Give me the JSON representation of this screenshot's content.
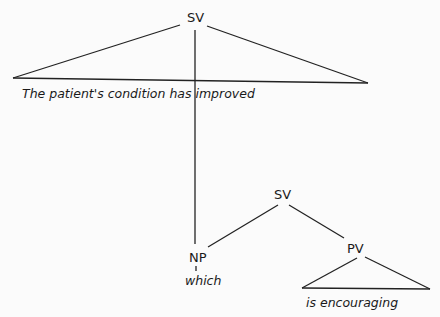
{
  "diagram": {
    "type": "syntax-tree",
    "nodes": {
      "top_sv": "SV",
      "lower_sv": "SV",
      "np": "NP",
      "pv": "PV"
    },
    "leaves": {
      "top_phrase": "The patient's condition has improved",
      "np_word": "which",
      "pv_phrase": "is encouraging"
    },
    "colors": {
      "ink": "#222222",
      "background": "#fbfbfb"
    }
  }
}
